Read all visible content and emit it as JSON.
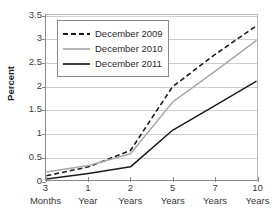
{
  "chart_data": {
    "type": "line",
    "title": "",
    "subtitle": "",
    "xlabel": "",
    "ylabel": "Percent",
    "ylim": [
      0,
      3.5
    ],
    "ytick_values": [
      0,
      0.5,
      1,
      1.5,
      2,
      2.5,
      3,
      3.5
    ],
    "ytick_labels": [
      "0",
      "0.5",
      "1",
      "1.5",
      "2",
      "2.5",
      "3",
      "3.5"
    ],
    "grid": true,
    "legend_position": "upper-left-inside",
    "categories": [
      "3 Months",
      "1 Year",
      "2 Years",
      "5 Years",
      "7 Years",
      "10 Years"
    ],
    "category_parts": [
      {
        "num": "3",
        "unit": "Months"
      },
      {
        "num": "1",
        "unit": "Year"
      },
      {
        "num": "2",
        "unit": "Years"
      },
      {
        "num": "5",
        "unit": "Years"
      },
      {
        "num": "7",
        "unit": "Years"
      },
      {
        "num": "10",
        "unit": "Years"
      }
    ],
    "series": [
      {
        "name": "December 2009",
        "color": "#1a1a1a",
        "style": "dashed",
        "values": [
          0.08,
          0.27,
          0.62,
          1.98,
          2.66,
          3.28
        ]
      },
      {
        "name": "December 2010",
        "color": "#a8a8a8",
        "style": "solid",
        "values": [
          0.16,
          0.3,
          0.55,
          1.65,
          2.3,
          2.97
        ]
      },
      {
        "name": "December 2011",
        "color": "#1a1a1a",
        "style": "solid",
        "values": [
          0.01,
          0.13,
          0.27,
          1.05,
          1.57,
          2.1
        ]
      }
    ]
  }
}
